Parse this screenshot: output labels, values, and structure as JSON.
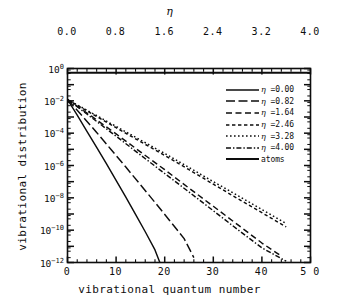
{
  "chart_data": {
    "type": "line",
    "title": "",
    "xlabel": "vibrational quantum number",
    "ylabel": "vibrational distribution",
    "top_axis_label": "η",
    "xlim": [
      0,
      50
    ],
    "ylim": [
      1e-12,
      1
    ],
    "yscale": "log",
    "grid": false,
    "legend_position": "upper right",
    "xticks": [
      "0",
      "10",
      "20",
      "30",
      "40",
      "5 0"
    ],
    "xtick_values": [
      0,
      10,
      20,
      30,
      40,
      50
    ],
    "top_xticks": [
      "0.0",
      "0.8",
      "1.6",
      "2.4",
      "3.2",
      "4.0"
    ],
    "top_xtick_values": [
      0.0,
      0.8,
      1.6,
      2.4,
      3.2,
      4.0
    ],
    "yticks": [
      "10^0",
      "10^-2",
      "10^-4",
      "10^-6",
      "10^-8",
      "10^-10",
      "10^-12"
    ],
    "ytick_exponents": [
      0,
      -2,
      -4,
      -6,
      -8,
      -10,
      -12
    ],
    "series": [
      {
        "name": "η =0.00",
        "eta": 0.0,
        "style": "solid",
        "x": [
          0,
          2,
          4,
          6,
          8,
          10,
          12,
          14,
          16,
          18,
          19
        ],
        "y": [
          0.012,
          0.0013,
          0.00013,
          1.3e-05,
          1.3e-06,
          1.2e-07,
          1.1e-08,
          9.5e-10,
          8e-11,
          6e-12,
          1e-12
        ]
      },
      {
        "name": "η =0.82",
        "eta": 0.82,
        "style": "long-dash",
        "x": [
          0,
          3,
          6,
          9,
          12,
          15,
          18,
          21,
          24,
          26
        ],
        "y": [
          0.012,
          0.0012,
          0.00011,
          9.5e-06,
          8e-07,
          6.5e-08,
          5.2e-09,
          4e-10,
          3e-11,
          2e-12
        ]
      },
      {
        "name": "η =1.64",
        "eta": 1.64,
        "style": "dash",
        "x": [
          0,
          5,
          10,
          15,
          20,
          25,
          30,
          35,
          40,
          44
        ],
        "y": [
          0.012,
          0.0011,
          9e-05,
          7e-06,
          5.5e-07,
          4e-08,
          3e-09,
          2.2e-10,
          1.6e-11,
          2.5e-12
        ]
      },
      {
        "name": "η =2.46",
        "eta": 2.46,
        "style": "dashed",
        "x": [
          0,
          5,
          10,
          15,
          20,
          25,
          30,
          35,
          40,
          45
        ],
        "y": [
          0.012,
          0.0016,
          0.00022,
          3e-05,
          4.2e-06,
          5.5e-07,
          7e-08,
          9e-09,
          1.2e-09,
          1.6e-10
        ]
      },
      {
        "name": "η =3.28",
        "eta": 3.28,
        "style": "dotted",
        "x": [
          0,
          5,
          10,
          15,
          20,
          25,
          30,
          35,
          40,
          45
        ],
        "y": [
          0.012,
          0.0018,
          0.00026,
          3.8e-05,
          5.5e-06,
          7.5e-07,
          1e-07,
          1.4e-08,
          1.9e-09,
          2.6e-10
        ]
      },
      {
        "name": "η =4.00",
        "eta": 4.0,
        "style": "dash-dot",
        "x": [
          0,
          5,
          10,
          15,
          20,
          25,
          30,
          35,
          40,
          45
        ],
        "y": [
          0.012,
          0.0009,
          6.5e-05,
          4.5e-06,
          3.2e-07,
          2.3e-08,
          1.6e-09,
          1.1e-10,
          8e-12,
          1.2e-12
        ]
      },
      {
        "name": "atoms",
        "style": "solid-thick",
        "constant": true,
        "x": [
          0,
          50
        ],
        "y": [
          0.55,
          0.55
        ]
      }
    ],
    "legend_entries": [
      {
        "label": "η =0.00",
        "style": "solid"
      },
      {
        "label": "η =0.82",
        "style": "long-dash"
      },
      {
        "label": "η =1.64",
        "style": "dash"
      },
      {
        "label": "η =2.46",
        "style": "dashed"
      },
      {
        "label": "η =3.28",
        "style": "dotted"
      },
      {
        "label": "η =4.00",
        "style": "dash-dot"
      },
      {
        "label": "atoms",
        "style": "solid-thick"
      }
    ],
    "line_color": "#0d0d0d"
  }
}
